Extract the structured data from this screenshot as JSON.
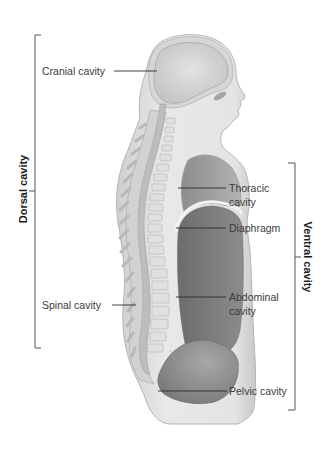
{
  "figure": {
    "type": "anatomical-diagram",
    "colors": {
      "background": "#ffffff",
      "skin": "#e6e6e6",
      "skin_edge": "#bdbdbd",
      "bone": "#d3d3d3",
      "cavity_light": "#b4b4b4",
      "cavity_thoracic": "#9a9a9a",
      "cavity_abdominal": "#7c7c7c",
      "leader_line": "#2b2b2b",
      "bracket": "#555555",
      "text": "#3c3c3c"
    }
  },
  "brackets": {
    "dorsal": {
      "label": "Dorsal cavity"
    },
    "ventral": {
      "label": "Ventral cavity"
    }
  },
  "labels": {
    "cranial": "Cranial cavity",
    "thoracic_line1": "Thoracic",
    "thoracic_line2": "cavity",
    "diaphragm": "Diaphragm",
    "spinal": "Spinal cavity",
    "abdominal_line1": "Abdominal",
    "abdominal_line2": "cavity",
    "pelvic": "Pelvic cavity"
  }
}
